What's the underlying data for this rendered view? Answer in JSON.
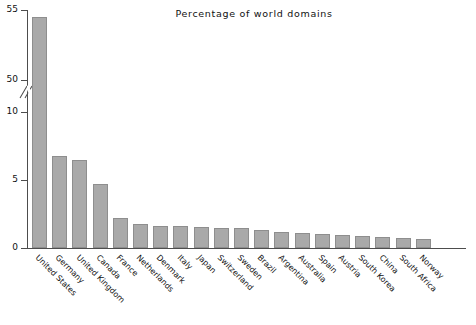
{
  "chart": {
    "title": "Percentage of world domains"
  },
  "chart_data": {
    "type": "bar",
    "title": "Percentage of world domains",
    "xlabel": "",
    "ylabel": "",
    "grid": false,
    "legend": false,
    "axis_break": {
      "present": true,
      "below": 10,
      "above": 50,
      "note": "y axis is broken between 10 and 50"
    },
    "ylim": [
      0,
      55
    ],
    "yticks": [
      0,
      5,
      10,
      50,
      55
    ],
    "ytick_labels": [
      "0",
      "5",
      "10",
      "50",
      "55"
    ],
    "categories": [
      "United States",
      "Germany",
      "United Kingdom",
      "Canada",
      "France",
      "Netherlands",
      "Denmark",
      "Italy",
      "Japan",
      "Switzerland",
      "Sweden",
      "Brazil",
      "Argentina",
      "Australia",
      "Spain",
      "Austria",
      "South Korea",
      "China",
      "South Africa",
      "Norway"
    ],
    "values": [
      54.5,
      6.8,
      6.5,
      4.7,
      2.2,
      1.75,
      1.65,
      1.6,
      1.55,
      1.5,
      1.45,
      1.35,
      1.2,
      1.1,
      1.0,
      0.95,
      0.9,
      0.8,
      0.7,
      0.65
    ],
    "colors": {
      "bar_fill": "#a9a9a9",
      "bar_edge": "#8e8e8e",
      "axis": "#4d4d4d",
      "text": "#111111",
      "background": "#ffffff"
    }
  }
}
